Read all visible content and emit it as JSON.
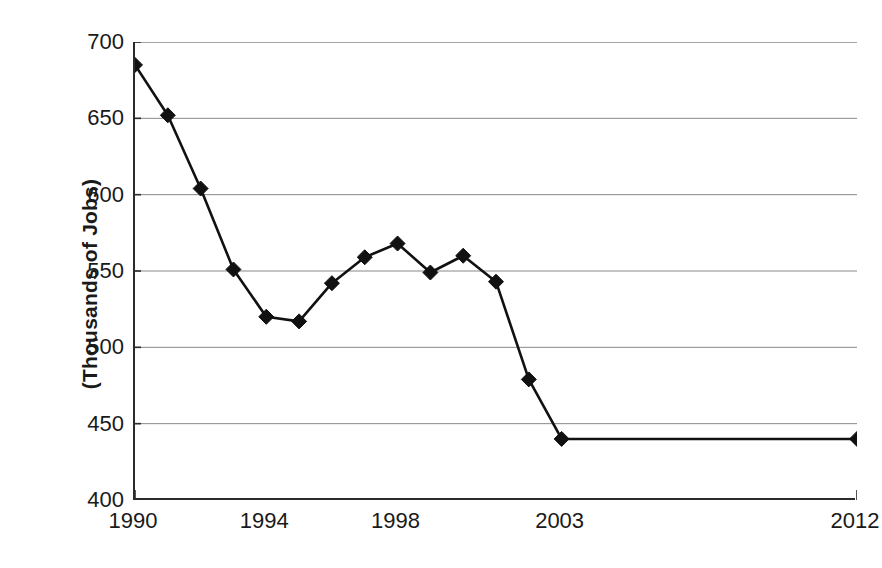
{
  "chart_data": {
    "type": "line",
    "title": "",
    "xlabel": "",
    "ylabel": "(Thousands of Jobs)",
    "x": [
      1990,
      1991,
      1992,
      1993,
      1994,
      1995,
      1996,
      1997,
      1998,
      1999,
      2000,
      2001,
      2002,
      2003,
      2012
    ],
    "values": [
      685,
      652,
      604,
      551,
      520,
      517,
      542,
      559,
      568,
      549,
      560,
      543,
      479,
      440,
      440
    ],
    "series": [
      {
        "name": "Jobs",
        "values": [
          685,
          652,
          604,
          551,
          520,
          517,
          542,
          559,
          568,
          549,
          560,
          543,
          479,
          440,
          440
        ]
      }
    ],
    "ylim": [
      400,
      700
    ],
    "xlim": [
      1990,
      2012
    ],
    "y_ticks": [
      700,
      650,
      600,
      550,
      500,
      450,
      400
    ],
    "y_tick_labels": [
      "700",
      "650",
      "600",
      "550",
      "500",
      "450",
      "400"
    ],
    "x_ticks": [
      1990,
      1991,
      1992,
      1993,
      1994,
      1995,
      1996,
      1997,
      1998,
      1999,
      2000,
      2001,
      2002,
      2003,
      2004,
      2005,
      2006,
      2007,
      2008,
      2009,
      2010,
      2011,
      2012
    ],
    "x_tick_labels_shown": [
      "1990",
      "1994",
      "1998",
      "2003",
      "2012"
    ],
    "x_tick_label_values": [
      1990,
      1994,
      1998,
      2003,
      2012
    ],
    "grid": "horizontal",
    "legend": "none",
    "marker": "diamond",
    "line_color": "#111111",
    "marker_color": "#111111",
    "grid_color": "#888888",
    "axis_color": "#2b2b2b",
    "background": "#ffffff"
  },
  "axis": {
    "y_title": "(Thousands of Jobs)"
  }
}
